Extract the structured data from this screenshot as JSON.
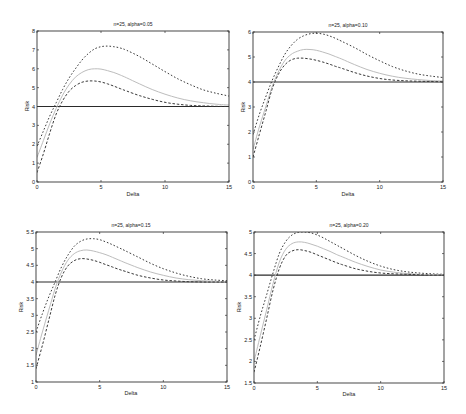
{
  "figure": {
    "layout": "2x2 grid of line plots",
    "colors": {
      "axes": "#333333",
      "reference": "#2a2a2a",
      "bound": "#3a3a3a",
      "middle": "#bdbdbd"
    }
  },
  "chart_data": [
    {
      "type": "line",
      "title": "n=25, alpha=0.05",
      "xlabel": "Delta",
      "ylabel": "Risk",
      "xlim": [
        0,
        15
      ],
      "ylim": [
        0,
        8
      ],
      "xticks": [
        0,
        5,
        10,
        15
      ],
      "yticks": [
        0,
        1,
        2,
        3,
        4,
        5,
        6,
        7,
        8
      ],
      "grid": false,
      "legend": null,
      "x": [
        0,
        0.5,
        1,
        1.5,
        2,
        2.5,
        3,
        3.5,
        4,
        4.5,
        5,
        5.5,
        6,
        6.5,
        7,
        8,
        9,
        10,
        11,
        12,
        13,
        14,
        15
      ],
      "series": [
        {
          "name": "reference",
          "style": "solid",
          "values": [
            4,
            4,
            4,
            4,
            4,
            4,
            4,
            4,
            4,
            4,
            4,
            4,
            4,
            4,
            4,
            4,
            4,
            4,
            4,
            4,
            4,
            4,
            4
          ]
        },
        {
          "name": "upper bound",
          "style": "dotted",
          "values": [
            1.9,
            2.7,
            3.5,
            4.2,
            4.9,
            5.5,
            6.0,
            6.45,
            6.8,
            7.05,
            7.17,
            7.2,
            7.17,
            7.1,
            6.98,
            6.65,
            6.25,
            5.85,
            5.47,
            5.15,
            4.88,
            4.7,
            4.55
          ]
        },
        {
          "name": "middle",
          "style": "light",
          "values": [
            1.3,
            2.2,
            3.1,
            3.9,
            4.6,
            5.15,
            5.55,
            5.8,
            5.95,
            6.0,
            5.98,
            5.9,
            5.8,
            5.67,
            5.52,
            5.2,
            4.9,
            4.65,
            4.45,
            4.3,
            4.2,
            4.12,
            4.08
          ]
        },
        {
          "name": "lower bound",
          "style": "dashed",
          "values": [
            0.5,
            1.5,
            2.6,
            3.6,
            4.3,
            4.8,
            5.1,
            5.28,
            5.35,
            5.35,
            5.3,
            5.2,
            5.08,
            4.95,
            4.82,
            4.58,
            4.38,
            4.22,
            4.12,
            4.06,
            4.03,
            4.01,
            4.0
          ]
        }
      ]
    },
    {
      "type": "line",
      "title": "n=25, alpha=0.10",
      "xlabel": "Delta",
      "ylabel": "Risk",
      "xlim": [
        0,
        15
      ],
      "ylim": [
        0,
        6
      ],
      "xticks": [
        0,
        5,
        10,
        15
      ],
      "yticks": [
        0,
        1,
        2,
        3,
        4,
        5,
        6
      ],
      "grid": false,
      "legend": null,
      "x": [
        0,
        0.5,
        1,
        1.5,
        2,
        2.5,
        3,
        3.5,
        4,
        4.5,
        5,
        5.5,
        6,
        6.5,
        7,
        8,
        9,
        10,
        11,
        12,
        13,
        14,
        15
      ],
      "series": [
        {
          "name": "reference",
          "style": "solid",
          "values": [
            4,
            4,
            4,
            4,
            4,
            4,
            4,
            4,
            4,
            4,
            4,
            4,
            4,
            4,
            4,
            4,
            4,
            4,
            4,
            4,
            4,
            4,
            4
          ]
        },
        {
          "name": "upper bound",
          "style": "dotted",
          "values": [
            1.9,
            2.7,
            3.4,
            4.05,
            4.6,
            5.1,
            5.45,
            5.7,
            5.85,
            5.93,
            5.95,
            5.92,
            5.85,
            5.75,
            5.63,
            5.38,
            5.1,
            4.85,
            4.62,
            4.45,
            4.32,
            4.24,
            4.18
          ]
        },
        {
          "name": "middle",
          "style": "light",
          "values": [
            1.3,
            2.2,
            3.0,
            3.8,
            4.4,
            4.85,
            5.1,
            5.23,
            5.3,
            5.3,
            5.27,
            5.2,
            5.12,
            5.02,
            4.92,
            4.7,
            4.5,
            4.35,
            4.23,
            4.15,
            4.1,
            4.06,
            4.04
          ]
        },
        {
          "name": "lower bound",
          "style": "dashed",
          "values": [
            1.0,
            1.9,
            2.8,
            3.7,
            4.3,
            4.68,
            4.88,
            4.95,
            4.95,
            4.92,
            4.87,
            4.8,
            4.72,
            4.63,
            4.55,
            4.38,
            4.24,
            4.14,
            4.08,
            4.05,
            4.03,
            4.02,
            4.01
          ]
        }
      ]
    },
    {
      "type": "line",
      "title": "n=25, alpha=0.15",
      "xlabel": "Delta",
      "ylabel": "Risk",
      "xlim": [
        0,
        15
      ],
      "ylim": [
        1,
        5.5
      ],
      "xticks": [
        0,
        5,
        10,
        15
      ],
      "yticks": [
        1,
        1.5,
        2,
        2.5,
        3,
        3.5,
        4,
        4.5,
        5,
        5.5
      ],
      "grid": false,
      "legend": null,
      "x": [
        0,
        0.5,
        1,
        1.5,
        2,
        2.5,
        3,
        3.5,
        4,
        4.5,
        5,
        5.5,
        6,
        6.5,
        7,
        8,
        9,
        10,
        11,
        12,
        13,
        14,
        15
      ],
      "series": [
        {
          "name": "reference",
          "style": "solid",
          "values": [
            4,
            4,
            4,
            4,
            4,
            4,
            4,
            4,
            4,
            4,
            4,
            4,
            4,
            4,
            4,
            4,
            4,
            4,
            4,
            4,
            4,
            4,
            4
          ]
        },
        {
          "name": "upper bound",
          "style": "dotted",
          "values": [
            2.5,
            3.05,
            3.55,
            4.0,
            4.45,
            4.8,
            5.07,
            5.22,
            5.29,
            5.3,
            5.27,
            5.2,
            5.12,
            5.03,
            4.94,
            4.75,
            4.56,
            4.4,
            4.27,
            4.17,
            4.1,
            4.06,
            4.04
          ]
        },
        {
          "name": "middle",
          "style": "light",
          "values": [
            1.8,
            2.5,
            3.15,
            3.8,
            4.3,
            4.65,
            4.85,
            4.94,
            4.96,
            4.93,
            4.88,
            4.82,
            4.74,
            4.66,
            4.58,
            4.43,
            4.3,
            4.2,
            4.12,
            4.07,
            4.04,
            4.02,
            4.01
          ]
        },
        {
          "name": "lower bound",
          "style": "dashed",
          "values": [
            1.4,
            2.1,
            2.85,
            3.6,
            4.15,
            4.48,
            4.64,
            4.7,
            4.69,
            4.65,
            4.59,
            4.52,
            4.45,
            4.38,
            4.32,
            4.2,
            4.12,
            4.06,
            4.03,
            4.01,
            4.0,
            4.0,
            4.0
          ]
        }
      ]
    },
    {
      "type": "line",
      "title": "n=25, alpha=0.20",
      "xlabel": "Delta",
      "ylabel": "Risk",
      "xlim": [
        0,
        15
      ],
      "ylim": [
        1.5,
        5
      ],
      "xticks": [
        0,
        5,
        10,
        15
      ],
      "yticks": [
        1.5,
        2,
        2.5,
        3,
        3.5,
        4,
        4.5,
        5
      ],
      "grid": false,
      "legend": null,
      "x": [
        0,
        0.5,
        1,
        1.5,
        2,
        2.5,
        3,
        3.5,
        4,
        4.5,
        5,
        5.5,
        6,
        6.5,
        7,
        8,
        9,
        10,
        11,
        12,
        13,
        14,
        15
      ],
      "series": [
        {
          "name": "reference",
          "style": "solid",
          "values": [
            4,
            4,
            4,
            4,
            4,
            4,
            4,
            4,
            4,
            4,
            4,
            4,
            4,
            4,
            4,
            4,
            4,
            4,
            4,
            4,
            4,
            4,
            4
          ]
        },
        {
          "name": "upper bound",
          "style": "dotted",
          "values": [
            2.5,
            3.05,
            3.55,
            4.05,
            4.5,
            4.78,
            4.93,
            4.99,
            5.0,
            4.98,
            4.93,
            4.86,
            4.78,
            4.7,
            4.62,
            4.46,
            4.32,
            4.21,
            4.13,
            4.08,
            4.05,
            4.03,
            4.02
          ]
        },
        {
          "name": "middle",
          "style": "light",
          "values": [
            2.0,
            2.6,
            3.2,
            3.8,
            4.3,
            4.6,
            4.73,
            4.77,
            4.76,
            4.72,
            4.67,
            4.61,
            4.55,
            4.48,
            4.42,
            4.3,
            4.2,
            4.12,
            4.07,
            4.04,
            4.02,
            4.01,
            4.01
          ]
        },
        {
          "name": "lower bound",
          "style": "dashed",
          "values": [
            1.75,
            2.35,
            3.0,
            3.65,
            4.15,
            4.45,
            4.56,
            4.59,
            4.57,
            4.53,
            4.47,
            4.41,
            4.35,
            4.29,
            4.24,
            4.15,
            4.09,
            4.05,
            4.03,
            4.02,
            4.01,
            4.0,
            4.0
          ]
        }
      ]
    }
  ]
}
